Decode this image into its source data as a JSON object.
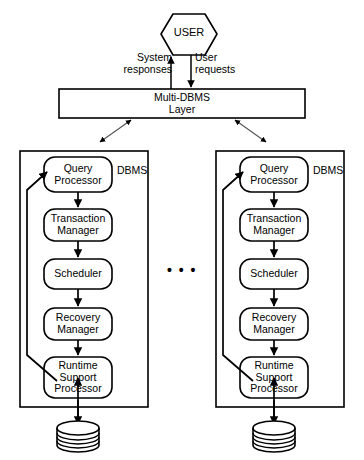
{
  "diagram": {
    "colors": {
      "stroke": "#000000",
      "background": "#ffffff",
      "connector_light": "#8c8c8c"
    },
    "user": {
      "label": "USER",
      "shape": "hexagon"
    },
    "flows": {
      "system_responses": "System\nresponses",
      "user_requests": "User\nrequests"
    },
    "layer": {
      "line1": "Multi-DBMS",
      "line2": "Layer"
    },
    "ellipsis": "• • •",
    "dbms_instances": [
      {
        "tag": "DBMS",
        "nodes": [
          "Query\nProcessor",
          "Transaction\nManager",
          "Scheduler",
          "Recovery\nManager",
          "Runtime\nSupport\nProcessor"
        ],
        "database_icon": "database-cylinder"
      },
      {
        "tag": "DBMS",
        "nodes": [
          "Query\nProcessor",
          "Transaction\nManager",
          "Scheduler",
          "Recovery\nManager",
          "Runtime\nSupport\nProcessor"
        ],
        "database_icon": "database-cylinder"
      }
    ]
  }
}
